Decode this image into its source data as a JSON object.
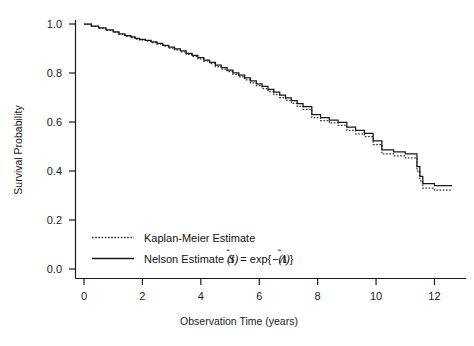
{
  "chart_data": {
    "type": "line",
    "title": "",
    "xlabel": "Observation Time (years)",
    "ylabel": "Survival Probability",
    "xlim": [
      0,
      12.6
    ],
    "ylim": [
      0.0,
      1.0
    ],
    "xticks": [
      "0",
      "2",
      "4",
      "6",
      "8",
      "10",
      "12"
    ],
    "xtick_values": [
      0,
      2,
      4,
      6,
      8,
      10,
      12
    ],
    "yticks": [
      "0.0",
      "0.2",
      "0.4",
      "0.6",
      "0.8",
      "1.0"
    ],
    "ytick_values": [
      0.0,
      0.2,
      0.4,
      0.6,
      0.8,
      1.0
    ],
    "grid": false,
    "legend_position": "lower-left",
    "series": [
      {
        "name": "Kaplan-Meier Estimate",
        "style": "dotted",
        "color": "#333333",
        "x": [
          0.0,
          0.25,
          0.5,
          0.75,
          1.0,
          1.2,
          1.4,
          1.6,
          1.75,
          1.9,
          2.1,
          2.3,
          2.5,
          2.7,
          2.9,
          3.1,
          3.3,
          3.5,
          3.7,
          3.9,
          4.1,
          4.3,
          4.5,
          4.7,
          4.9,
          5.1,
          5.3,
          5.5,
          5.7,
          5.9,
          6.1,
          6.3,
          6.5,
          6.7,
          6.9,
          7.1,
          7.3,
          7.5,
          7.8,
          8.1,
          8.4,
          8.7,
          9.0,
          9.3,
          9.6,
          9.9,
          10.2,
          10.6,
          11.0,
          11.4,
          11.5,
          11.6,
          12.0,
          12.6
        ],
        "y": [
          1.0,
          0.99,
          0.982,
          0.974,
          0.966,
          0.958,
          0.95,
          0.944,
          0.938,
          0.934,
          0.93,
          0.924,
          0.918,
          0.91,
          0.902,
          0.894,
          0.886,
          0.876,
          0.868,
          0.858,
          0.848,
          0.838,
          0.826,
          0.816,
          0.806,
          0.794,
          0.784,
          0.772,
          0.76,
          0.748,
          0.736,
          0.724,
          0.712,
          0.7,
          0.688,
          0.676,
          0.664,
          0.652,
          0.618,
          0.606,
          0.596,
          0.586,
          0.566,
          0.552,
          0.54,
          0.508,
          0.47,
          0.462,
          0.454,
          0.4,
          0.36,
          0.33,
          0.322,
          0.322
        ]
      },
      {
        "name": "Nelson Estimate",
        "style": "solid",
        "color": "#1a1a1a",
        "math": "Ŝ(t) = exp{−Λ̂(t)}",
        "x": [
          0.0,
          0.25,
          0.5,
          0.75,
          1.0,
          1.2,
          1.4,
          1.6,
          1.75,
          1.9,
          2.1,
          2.3,
          2.5,
          2.7,
          2.9,
          3.1,
          3.3,
          3.5,
          3.7,
          3.9,
          4.1,
          4.3,
          4.5,
          4.7,
          4.9,
          5.1,
          5.3,
          5.5,
          5.7,
          5.9,
          6.1,
          6.3,
          6.5,
          6.7,
          6.9,
          7.1,
          7.3,
          7.5,
          7.8,
          8.1,
          8.4,
          8.7,
          9.0,
          9.3,
          9.6,
          9.9,
          10.2,
          10.6,
          11.0,
          11.4,
          11.5,
          11.6,
          12.0,
          12.6
        ],
        "y": [
          1.0,
          0.991,
          0.984,
          0.976,
          0.968,
          0.96,
          0.953,
          0.947,
          0.941,
          0.937,
          0.933,
          0.927,
          0.921,
          0.913,
          0.906,
          0.898,
          0.89,
          0.88,
          0.872,
          0.863,
          0.853,
          0.843,
          0.832,
          0.822,
          0.812,
          0.801,
          0.791,
          0.78,
          0.768,
          0.756,
          0.745,
          0.733,
          0.722,
          0.71,
          0.698,
          0.687,
          0.675,
          0.663,
          0.63,
          0.618,
          0.608,
          0.598,
          0.579,
          0.566,
          0.554,
          0.523,
          0.486,
          0.478,
          0.47,
          0.418,
          0.378,
          0.348,
          0.34,
          0.34
        ]
      }
    ]
  },
  "legend": {
    "items": [
      {
        "label": "Kaplan-Meier Estimate",
        "math": "",
        "style": "dotted"
      },
      {
        "label": "Nelson Estimate",
        "math": "Ŝ(t) = exp{−Λ̂(t)}",
        "style": "solid"
      }
    ]
  },
  "axes": {
    "x_title": "Observation Time (years)",
    "y_title": "Survival Probability"
  }
}
